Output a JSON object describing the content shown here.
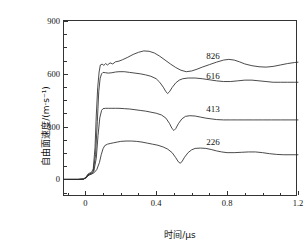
{
  "figure": {
    "title": "",
    "background": "#ffffff",
    "foreground": "#111111"
  },
  "axes": {
    "x_title": "时间/μs",
    "y_title": "自由面速度/(m·s⁻¹)",
    "x_ticks": [
      "0",
      "0.4",
      "0.8",
      "1.2"
    ],
    "y_ticks": [
      "0",
      "300",
      "600",
      "900"
    ]
  },
  "chart_data": {
    "type": "line",
    "title": "",
    "subtitle": "",
    "xlabel": "时间/μs",
    "ylabel": "自由面速度/(m·s⁻¹)",
    "xlim": [
      -0.12,
      1.2
    ],
    "ylim": [
      -100,
      900
    ],
    "x_ticks": [
      0,
      0.4,
      0.8,
      1.2
    ],
    "y_ticks": [
      0,
      300,
      600,
      900
    ],
    "x_minor_tick_step": 0.1,
    "y_minor_tick_step": 75,
    "grid": false,
    "legend": "inline-annotations",
    "legend_position": "right-of-curves",
    "line_color": "#2a2a2a",
    "series": [
      {
        "name": "826",
        "label": "826",
        "label_x": 0.72,
        "label_y": 700,
        "points": [
          [
            -0.12,
            0
          ],
          [
            -0.04,
            0
          ],
          [
            -0.01,
            2
          ],
          [
            0.005,
            14
          ],
          [
            0.015,
            30
          ],
          [
            0.025,
            36
          ],
          [
            0.035,
            40
          ],
          [
            0.045,
            60
          ],
          [
            0.055,
            180
          ],
          [
            0.062,
            360
          ],
          [
            0.07,
            520
          ],
          [
            0.078,
            610
          ],
          [
            0.085,
            650
          ],
          [
            0.095,
            655
          ],
          [
            0.105,
            648
          ],
          [
            0.115,
            658
          ],
          [
            0.125,
            650
          ],
          [
            0.14,
            662
          ],
          [
            0.155,
            656
          ],
          [
            0.17,
            668
          ],
          [
            0.19,
            672
          ],
          [
            0.21,
            680
          ],
          [
            0.24,
            694
          ],
          [
            0.27,
            710
          ],
          [
            0.3,
            722
          ],
          [
            0.33,
            730
          ],
          [
            0.36,
            728
          ],
          [
            0.39,
            718
          ],
          [
            0.42,
            700
          ],
          [
            0.45,
            678
          ],
          [
            0.48,
            656
          ],
          [
            0.51,
            636
          ],
          [
            0.54,
            620
          ],
          [
            0.57,
            612
          ],
          [
            0.6,
            616
          ],
          [
            0.63,
            626
          ],
          [
            0.66,
            638
          ],
          [
            0.7,
            652
          ],
          [
            0.74,
            666
          ],
          [
            0.78,
            678
          ],
          [
            0.81,
            682
          ],
          [
            0.84,
            678
          ],
          [
            0.87,
            668
          ],
          [
            0.9,
            656
          ],
          [
            0.94,
            646
          ],
          [
            0.98,
            640
          ],
          [
            1.02,
            638
          ],
          [
            1.06,
            642
          ],
          [
            1.1,
            650
          ],
          [
            1.14,
            658
          ],
          [
            1.18,
            664
          ],
          [
            1.2,
            666
          ]
        ]
      },
      {
        "name": "616",
        "label": "616",
        "label_x": 0.72,
        "label_y": 586,
        "points": [
          [
            -0.12,
            0
          ],
          [
            -0.04,
            0
          ],
          [
            -0.01,
            2
          ],
          [
            0.005,
            12
          ],
          [
            0.015,
            26
          ],
          [
            0.025,
            32
          ],
          [
            0.035,
            36
          ],
          [
            0.045,
            46
          ],
          [
            0.058,
            140
          ],
          [
            0.068,
            330
          ],
          [
            0.076,
            500
          ],
          [
            0.084,
            575
          ],
          [
            0.092,
            600
          ],
          [
            0.1,
            608
          ],
          [
            0.115,
            606
          ],
          [
            0.13,
            604
          ],
          [
            0.15,
            606
          ],
          [
            0.17,
            610
          ],
          [
            0.19,
            612
          ],
          [
            0.22,
            612
          ],
          [
            0.25,
            608
          ],
          [
            0.28,
            604
          ],
          [
            0.31,
            600
          ],
          [
            0.34,
            594
          ],
          [
            0.37,
            586
          ],
          [
            0.4,
            572
          ],
          [
            0.42,
            552
          ],
          [
            0.44,
            524
          ],
          [
            0.455,
            498
          ],
          [
            0.465,
            488
          ],
          [
            0.475,
            498
          ],
          [
            0.49,
            522
          ],
          [
            0.51,
            548
          ],
          [
            0.53,
            564
          ],
          [
            0.55,
            572
          ],
          [
            0.58,
            576
          ],
          [
            0.62,
            576
          ],
          [
            0.66,
            572
          ],
          [
            0.7,
            566
          ],
          [
            0.74,
            560
          ],
          [
            0.78,
            556
          ],
          [
            0.82,
            556
          ],
          [
            0.86,
            560
          ],
          [
            0.9,
            564
          ],
          [
            0.94,
            564
          ],
          [
            0.98,
            560
          ],
          [
            1.02,
            556
          ],
          [
            1.06,
            552
          ],
          [
            1.1,
            552
          ],
          [
            1.14,
            552
          ],
          [
            1.18,
            552
          ],
          [
            1.2,
            552
          ]
        ]
      },
      {
        "name": "413",
        "label": "413",
        "label_x": 0.72,
        "label_y": 400,
        "points": [
          [
            -0.12,
            0
          ],
          [
            -0.04,
            0
          ],
          [
            -0.01,
            2
          ],
          [
            0.005,
            10
          ],
          [
            0.015,
            22
          ],
          [
            0.025,
            28
          ],
          [
            0.035,
            32
          ],
          [
            0.048,
            44
          ],
          [
            0.062,
            120
          ],
          [
            0.072,
            250
          ],
          [
            0.082,
            350
          ],
          [
            0.092,
            392
          ],
          [
            0.1,
            402
          ],
          [
            0.115,
            404
          ],
          [
            0.13,
            404
          ],
          [
            0.15,
            404
          ],
          [
            0.17,
            404
          ],
          [
            0.19,
            404
          ],
          [
            0.22,
            402
          ],
          [
            0.25,
            400
          ],
          [
            0.28,
            396
          ],
          [
            0.31,
            392
          ],
          [
            0.34,
            388
          ],
          [
            0.37,
            382
          ],
          [
            0.4,
            376
          ],
          [
            0.43,
            366
          ],
          [
            0.455,
            348
          ],
          [
            0.475,
            318
          ],
          [
            0.49,
            288
          ],
          [
            0.5,
            278
          ],
          [
            0.51,
            288
          ],
          [
            0.525,
            316
          ],
          [
            0.545,
            344
          ],
          [
            0.565,
            358
          ],
          [
            0.59,
            362
          ],
          [
            0.62,
            360
          ],
          [
            0.65,
            354
          ],
          [
            0.68,
            348
          ],
          [
            0.71,
            344
          ],
          [
            0.74,
            340
          ],
          [
            0.78,
            338
          ],
          [
            0.82,
            338
          ],
          [
            0.86,
            338
          ],
          [
            0.9,
            338
          ],
          [
            0.95,
            338
          ],
          [
            1.0,
            338
          ],
          [
            1.05,
            338
          ],
          [
            1.1,
            338
          ],
          [
            1.15,
            338
          ],
          [
            1.2,
            338
          ]
        ]
      },
      {
        "name": "226",
        "label": "226",
        "label_x": 0.72,
        "label_y": 212,
        "points": [
          [
            -0.12,
            0
          ],
          [
            -0.04,
            0
          ],
          [
            -0.01,
            2
          ],
          [
            0.005,
            8
          ],
          [
            0.015,
            20
          ],
          [
            0.025,
            26
          ],
          [
            0.035,
            30
          ],
          [
            0.05,
            38
          ],
          [
            0.065,
            56
          ],
          [
            0.08,
            96
          ],
          [
            0.09,
            140
          ],
          [
            0.1,
            174
          ],
          [
            0.11,
            192
          ],
          [
            0.125,
            200
          ],
          [
            0.14,
            204
          ],
          [
            0.16,
            208
          ],
          [
            0.18,
            212
          ],
          [
            0.2,
            216
          ],
          [
            0.23,
            218
          ],
          [
            0.26,
            218
          ],
          [
            0.29,
            216
          ],
          [
            0.32,
            212
          ],
          [
            0.35,
            206
          ],
          [
            0.38,
            200
          ],
          [
            0.41,
            194
          ],
          [
            0.44,
            184
          ],
          [
            0.465,
            172
          ],
          [
            0.49,
            152
          ],
          [
            0.51,
            124
          ],
          [
            0.525,
            100
          ],
          [
            0.535,
            92
          ],
          [
            0.545,
            100
          ],
          [
            0.56,
            126
          ],
          [
            0.58,
            152
          ],
          [
            0.6,
            168
          ],
          [
            0.62,
            176
          ],
          [
            0.65,
            178
          ],
          [
            0.68,
            176
          ],
          [
            0.71,
            170
          ],
          [
            0.74,
            162
          ],
          [
            0.77,
            156
          ],
          [
            0.8,
            152
          ],
          [
            0.84,
            152
          ],
          [
            0.88,
            154
          ],
          [
            0.92,
            156
          ],
          [
            0.96,
            156
          ],
          [
            1.0,
            152
          ],
          [
            1.04,
            146
          ],
          [
            1.08,
            142
          ],
          [
            1.12,
            140
          ],
          [
            1.16,
            140
          ],
          [
            1.2,
            140
          ]
        ]
      }
    ]
  }
}
